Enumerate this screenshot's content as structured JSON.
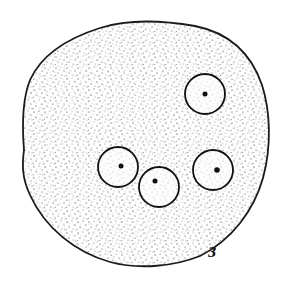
{
  "figure": {
    "label": "3",
    "outline_color": "#1a1a1a",
    "stipple_color": "#2a2a2a",
    "background": "#ffffff",
    "nuclei": [
      {
        "name": "nucleus-top-right",
        "cx": 199,
        "cy": 94,
        "r": 20
      },
      {
        "name": "nucleus-left",
        "cx": 118,
        "cy": 167,
        "r": 20
      },
      {
        "name": "nucleus-middle",
        "cx": 159,
        "cy": 187,
        "r": 20
      },
      {
        "name": "nucleus-right",
        "cx": 213,
        "cy": 170,
        "r": 20
      }
    ]
  }
}
